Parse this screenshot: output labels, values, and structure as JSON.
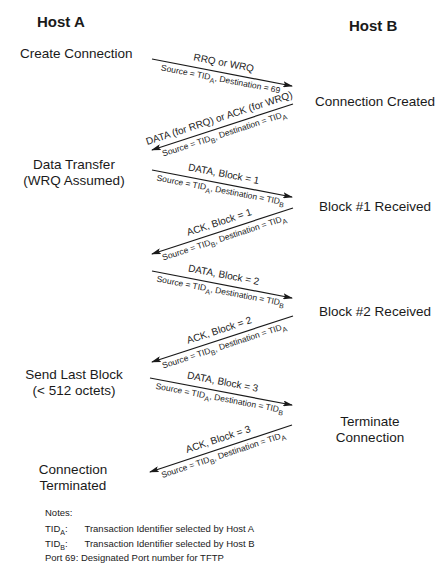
{
  "hosts": {
    "a": "Host  A",
    "b": "Host  B"
  },
  "host_a_states": [
    {
      "line1": "Create Connection",
      "line2": ""
    },
    {
      "line1": "Data Transfer",
      "line2": "(WRQ Assumed)"
    },
    {
      "line1": "Send Last Block",
      "line2": "(< 512 octets)"
    },
    {
      "line1": "Connection",
      "line2": "Terminated"
    }
  ],
  "host_b_states": [
    {
      "line1": "Connection Created",
      "line2": ""
    },
    {
      "line1": "Block #1 Received",
      "line2": ""
    },
    {
      "line1": "Block #2 Received",
      "line2": ""
    },
    {
      "line1": "Terminate",
      "line2": "Connection"
    }
  ],
  "messages": [
    {
      "direction": "A->B",
      "label": "RRQ or WRQ",
      "src_prefix": "Source = TID",
      "src_sub": "A",
      "dst_prefix": ", Destination = 69",
      "dst_sub": ""
    },
    {
      "direction": "B->A",
      "label": "DATA (for RRQ) or ACK (for WRQ)",
      "src_prefix": "Source = TID",
      "src_sub": "B",
      "dst_prefix": ", Destination = TID",
      "dst_sub": "A"
    },
    {
      "direction": "A->B",
      "label": "DATA, Block = 1",
      "src_prefix": "Source = TID",
      "src_sub": "A",
      "dst_prefix": ", Destination = TID",
      "dst_sub": "B"
    },
    {
      "direction": "B->A",
      "label": "ACK, Block = 1",
      "src_prefix": "Source = TID",
      "src_sub": "B",
      "dst_prefix": ", Destination = TID",
      "dst_sub": "A"
    },
    {
      "direction": "A->B",
      "label": "DATA, Block = 2",
      "src_prefix": "Source = TID",
      "src_sub": "A",
      "dst_prefix": ", Destination = TID",
      "dst_sub": "B"
    },
    {
      "direction": "B->A",
      "label": "ACK, Block = 2",
      "src_prefix": "Source = TID",
      "src_sub": "B",
      "dst_prefix": ", Destination = TID",
      "dst_sub": "A"
    },
    {
      "direction": "A->B",
      "label": "DATA, Block = 3",
      "src_prefix": "Source = TID",
      "src_sub": "A",
      "dst_prefix": ", Destination = TID",
      "dst_sub": "B"
    },
    {
      "direction": "B->A",
      "label": "ACK, Block = 3",
      "src_prefix": "Source = TID",
      "src_sub": "B",
      "dst_prefix": ", Destination = TID",
      "dst_sub": "A"
    }
  ],
  "notes": {
    "title": "Notes:",
    "items": [
      {
        "key": "TID",
        "key_sub": "A",
        "key_suffix": ":",
        "text": "Transaction Identifier selected by Host A"
      },
      {
        "key": "TID",
        "key_sub": "B",
        "key_suffix": ":",
        "text": "Transaction Identifier selected by Host B"
      },
      {
        "key": "Port 69:",
        "key_sub": "",
        "key_suffix": "",
        "text": "Designated Port number for TFTP"
      }
    ]
  }
}
